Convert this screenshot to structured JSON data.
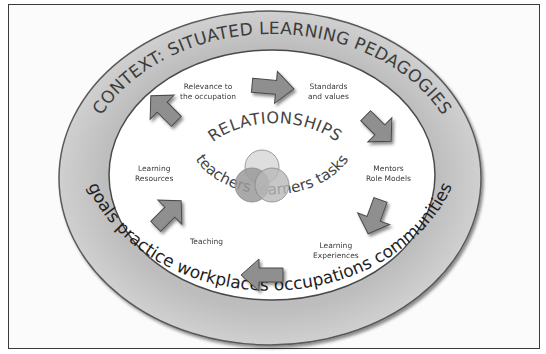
{
  "diagram": {
    "context_arc_top": "CONTEXT: SITUATED LEARNING PEDAGOGIES",
    "context_arc_bottom": "goals practice workplaces occupations communities",
    "center_title": "RELATIONSHIPS",
    "center_subtitle": "teachers learners tasks",
    "cycle_items": [
      {
        "line1": "Relevance to",
        "line2": "the occupation"
      },
      {
        "line1": "Standards",
        "line2": "and values"
      },
      {
        "line1": "Mentors",
        "line2": "Role Models"
      },
      {
        "line1": "Learning",
        "line2": "Experiences"
      },
      {
        "line1": "Teaching",
        "line2": ""
      },
      {
        "line1": "Learning",
        "line2": "Resources"
      }
    ],
    "venn_circles": 3,
    "colors": {
      "ring": "#c4c4c4",
      "ring_edge": "#5a5a5a",
      "arrow": "#8f8f8f",
      "arrow_edge": "#4a4a4a",
      "text": "#3a3a3a",
      "venn_dark": "#9a9a9a",
      "venn_mid": "#b8b8b8",
      "venn_light": "#d8d8d8"
    }
  }
}
